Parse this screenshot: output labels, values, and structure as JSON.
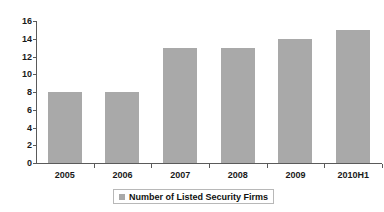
{
  "chart_data": {
    "type": "bar",
    "title": "",
    "subtitle": "",
    "xlabel": "",
    "ylabel": "",
    "categories": [
      "2005",
      "2006",
      "2007",
      "2008",
      "2009",
      "2010H1"
    ],
    "values": [
      8,
      8,
      13,
      13,
      14,
      15
    ],
    "series": [
      {
        "name": "Number of Listed Security Firms",
        "values": [
          8,
          8,
          13,
          13,
          14,
          15
        ],
        "color": "#a9a9a9"
      }
    ],
    "ylim": [
      0,
      16
    ],
    "ytick_step": 2,
    "yticks": [
      16,
      14,
      12,
      10,
      8,
      6,
      4,
      2,
      0
    ],
    "grid": false,
    "legend": {
      "position": "bottom",
      "entries": [
        {
          "label": "Number of Listed Security Firms",
          "color": "#a9a9a9",
          "marker": "square"
        }
      ]
    },
    "axis_color": "#5a5a5a",
    "background": "#ffffff",
    "text_color": "#1a1a1a"
  }
}
